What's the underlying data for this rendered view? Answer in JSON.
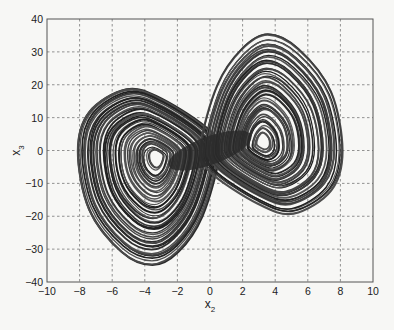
{
  "chart_data": {
    "type": "line",
    "title": "",
    "xlabel": "x2",
    "ylabel": "x3",
    "xlabel_main": "x",
    "xlabel_sub": "2",
    "ylabel_main": "x",
    "ylabel_sub": "3",
    "xlim": [
      -10,
      10
    ],
    "ylim": [
      -40,
      40
    ],
    "xticks": [
      -10,
      -8,
      -6,
      -4,
      -2,
      0,
      2,
      4,
      6,
      8,
      10
    ],
    "yticks": [
      -40,
      -30,
      -20,
      -10,
      0,
      10,
      20,
      30,
      40
    ],
    "grid": true,
    "grid_style": "dashed",
    "legend": null,
    "series": [
      {
        "name": "trajectory",
        "color": "#2a2a2a",
        "lobes": [
          {
            "name": "left-lobe",
            "center": [
              -3.2,
              -2
            ],
            "extent": {
              "x_min": -8.2,
              "x_max": 0.5,
              "y_min": -35,
              "y_max": 19
            },
            "outer_points": [
              [
                -8.2,
                0
              ],
              [
                -7.5,
                12
              ],
              [
                -5.2,
                19
              ],
              [
                -3,
                16
              ],
              [
                0,
                6
              ],
              [
                0.5,
                -2
              ],
              [
                -0.5,
                -20
              ],
              [
                -2,
                -31
              ],
              [
                -3.6,
                -35
              ],
              [
                -5.5,
                -31
              ],
              [
                -7.5,
                -18
              ]
            ]
          },
          {
            "name": "right-lobe",
            "center": [
              3.2,
              2
            ],
            "extent": {
              "x_min": -0.5,
              "x_max": 8.2,
              "y_min": -18,
              "y_max": 36
            },
            "outer_points": [
              [
                8.2,
                0
              ],
              [
                7.5,
                -12
              ],
              [
                5.2,
                -19
              ],
              [
                3,
                -16
              ],
              [
                0,
                -6
              ],
              [
                -0.5,
                2
              ],
              [
                0.5,
                20
              ],
              [
                2,
                31
              ],
              [
                3.6,
                35.5
              ],
              [
                5.5,
                31
              ],
              [
                7.5,
                18
              ]
            ]
          }
        ]
      }
    ]
  },
  "colors": {
    "background": "#f7f7f5",
    "axes": "#555555",
    "grid": "#777777",
    "trajectory": "#2a2a2a",
    "text": "#222222"
  },
  "plot_area_px": {
    "left": 47,
    "top": 19,
    "right": 373,
    "bottom": 282
  }
}
